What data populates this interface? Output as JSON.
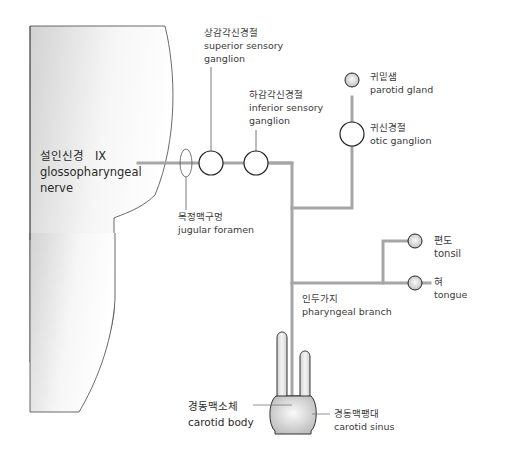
{
  "colors": {
    "nerve_line": "#a6a6a6",
    "outline": "#333333",
    "skull_fill_light": "#ffffff",
    "skull_fill_dark": "#d4d4d4",
    "gland_fill": "#e6e6e6",
    "text": "#3a3a3a"
  },
  "labels": {
    "nerve": {
      "ko": "설인신경",
      "numeral": "IX",
      "en_line1": "glossopharyngeal",
      "en_line2": "nerve"
    },
    "superior_ganglion": {
      "ko": "상감각신경절",
      "en_line1": "superior sensory",
      "en_line2": "ganglion"
    },
    "inferior_ganglion": {
      "ko": "하감각신경절",
      "en_line1": "inferior sensory",
      "en_line2": "ganglion"
    },
    "jugular_foramen": {
      "ko": "목정맥구멍",
      "en": "jugular foramen"
    },
    "parotid_gland": {
      "ko": "귀밑샘",
      "en": "parotid gland"
    },
    "otic_ganglion": {
      "ko": "귀신경절",
      "en": "otic ganglion"
    },
    "tonsil": {
      "ko": "편도",
      "en": "tonsil"
    },
    "tongue": {
      "ko": "혀",
      "en": "tongue"
    },
    "pharyngeal_branch": {
      "ko": "인두가지",
      "en": "pharyngeal branch"
    },
    "carotid_body": {
      "ko": "경동맥소체",
      "en": "carotid body"
    },
    "carotid_sinus": {
      "ko": "경동맥팽대",
      "en": "carotid sinus"
    }
  }
}
